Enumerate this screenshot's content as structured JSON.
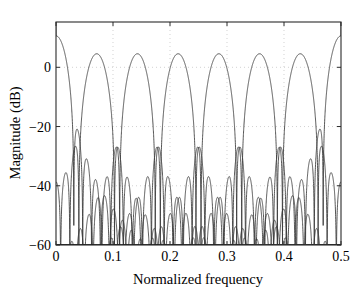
{
  "chart_data": {
    "type": "line",
    "title": "",
    "xlabel": "Normalized frequency",
    "ylabel": "Magnitude (dB)",
    "xlim": [
      0,
      0.5
    ],
    "ylim": [
      -60,
      15.3
    ],
    "xticks": [
      0,
      0.1,
      0.2,
      0.3,
      0.4,
      0.5
    ],
    "xticklabels": [
      "0",
      "0.1",
      "0.2",
      "0.3",
      "0.4",
      "0.5"
    ],
    "yticks": [
      0,
      -20,
      -40,
      -60
    ],
    "yticklabels": [
      "0",
      "-20",
      "-40",
      "-60"
    ],
    "grid": true,
    "legend": false,
    "legend_position": "none",
    "line_color": "#383838",
    "grid_color": "#bfbfbf",
    "axis_color": "#2b2b2b",
    "passband_peak_db": 10.6,
    "stopband_floor_db": -60,
    "series": [
      {
        "name": "Filter 1",
        "center_frequency": 0.0,
        "peak_db": 10.2
      },
      {
        "name": "Filter 2",
        "center_frequency": 0.0714,
        "peak_db": 10.6
      },
      {
        "name": "Filter 3",
        "center_frequency": 0.1429,
        "peak_db": 10.6
      },
      {
        "name": "Filter 4",
        "center_frequency": 0.2143,
        "peak_db": 10.6
      },
      {
        "name": "Filter 5",
        "center_frequency": 0.2857,
        "peak_db": 10.6
      },
      {
        "name": "Filter 6",
        "center_frequency": 0.3571,
        "peak_db": 10.6
      },
      {
        "name": "Filter 7",
        "center_frequency": 0.4286,
        "peak_db": 10.6
      },
      {
        "name": "Filter 8",
        "center_frequency": 0.5,
        "peak_db": 10.2
      }
    ],
    "filter_params": {
      "num_channels": 8,
      "band_spacing": 0.0714,
      "main_lobe_halfwidth": 0.0714,
      "null_spacing": 0.0179,
      "sidelobe_decay_db_per_decade": 22
    },
    "plot_box": {
      "left": 56,
      "top": 22,
      "right": 341,
      "bottom": 245
    }
  }
}
